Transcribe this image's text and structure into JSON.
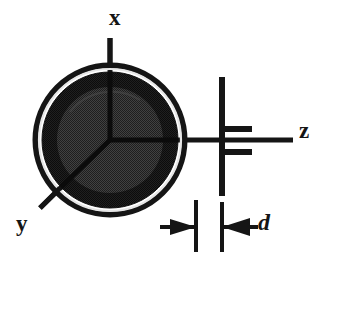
{
  "figure": {
    "kind": "technical-line-diagram",
    "background_color": "#ffffff",
    "width": 339,
    "height": 325
  },
  "labels": {
    "x_axis": "x",
    "y_axis": "y",
    "z_axis": "z",
    "dimension": "d"
  },
  "colors": {
    "ink": "#151515",
    "outer_ring": "#1a1a1a",
    "gap_ring": "#e8e8e8",
    "mid_ring": "#1c1c1c",
    "inner_disc": "#3a3a3a",
    "background": "#ffffff"
  },
  "geometry": {
    "circle_center_x": 110,
    "circle_center_y": 140,
    "outer_radius": 77,
    "gap_radius": 71,
    "mid_radius": 68,
    "inner_radius": 53,
    "line_weight": 5
  },
  "axes": [
    {
      "name": "x",
      "direction": "up",
      "tip_x": 110,
      "tip_y": 38,
      "origin_x": 110,
      "origin_y": 140
    },
    {
      "name": "y",
      "direction": "down-left",
      "tip_x": 40,
      "tip_y": 208,
      "origin_x": 110,
      "origin_y": 140
    },
    {
      "name": "z",
      "direction": "right",
      "tip_x": 293,
      "tip_y": 140,
      "origin_x": 110,
      "origin_y": 140
    }
  ],
  "dimension_marker": {
    "label": "d",
    "left_tick_x": 196,
    "right_tick_x": 222,
    "tick_top_y": 198,
    "tick_bottom_y": 252,
    "arrow_row_y": 227,
    "left_arrow_points_right": true,
    "right_arrow_points_left": true
  },
  "barrier": {
    "vertical_x": 222,
    "vertical_top_y": 77,
    "vertical_bottom_y": 196,
    "upper_stub_y": 128,
    "lower_stub_y": 152,
    "stub_right_x": 252
  }
}
